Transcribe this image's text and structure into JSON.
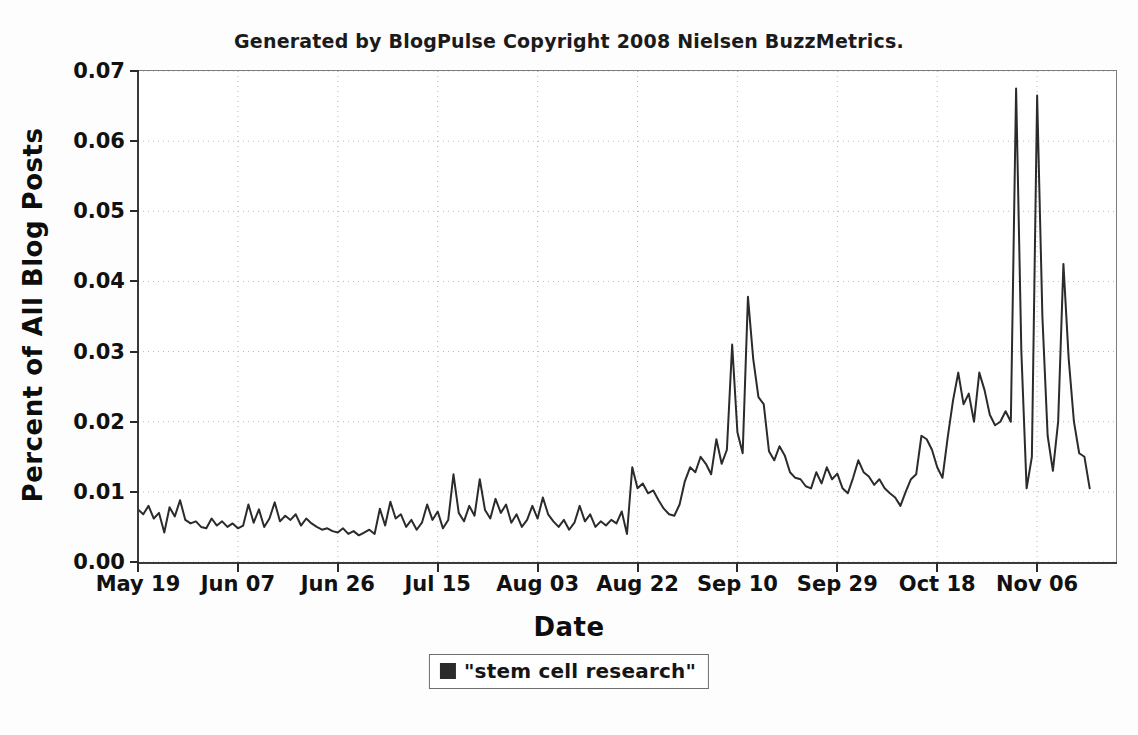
{
  "chart_data": {
    "type": "line",
    "title": "Generated by BlogPulse Copyright 2008 Nielsen BuzzMetrics.",
    "xlabel": "Date",
    "ylabel": "Percent of All Blog Posts",
    "legend": [
      "\"stem cell research\""
    ],
    "legend_position": "bottom-center",
    "grid": true,
    "grid_style": "dotted",
    "series_color": "#2b2b2b",
    "ylim": [
      0.0,
      0.07
    ],
    "ytick_labels": [
      "0.00",
      "0.01",
      "0.02",
      "0.03",
      "0.04",
      "0.05",
      "0.06",
      "0.07"
    ],
    "ytick_values": [
      0.0,
      0.01,
      0.02,
      0.03,
      0.04,
      0.05,
      0.06,
      0.07
    ],
    "xtick_labels": [
      "May 19",
      "Jun 07",
      "Jun 26",
      "Jul 15",
      "Aug 03",
      "Aug 22",
      "Sep 10",
      "Sep 29",
      "Oct 18",
      "Nov 06"
    ],
    "xtick_indices": [
      0,
      19,
      38,
      57,
      76,
      95,
      114,
      133,
      152,
      171
    ],
    "xlim_index": [
      0,
      186
    ],
    "series": [
      {
        "name": "\"stem cell research\"",
        "values": [
          0.0075,
          0.0068,
          0.008,
          0.0062,
          0.007,
          0.0042,
          0.0078,
          0.0065,
          0.0088,
          0.006,
          0.0055,
          0.0058,
          0.005,
          0.0048,
          0.0062,
          0.0052,
          0.0058,
          0.005,
          0.0055,
          0.0048,
          0.0052,
          0.0082,
          0.0056,
          0.0075,
          0.005,
          0.0062,
          0.0085,
          0.0058,
          0.0066,
          0.006,
          0.0068,
          0.0052,
          0.0062,
          0.0055,
          0.005,
          0.0046,
          0.0048,
          0.0044,
          0.0042,
          0.0048,
          0.004,
          0.0044,
          0.0038,
          0.0042,
          0.0046,
          0.004,
          0.0076,
          0.0052,
          0.0086,
          0.0062,
          0.0068,
          0.005,
          0.006,
          0.0046,
          0.0056,
          0.0082,
          0.006,
          0.0072,
          0.0048,
          0.006,
          0.0125,
          0.007,
          0.0058,
          0.008,
          0.0066,
          0.0118,
          0.0074,
          0.0062,
          0.009,
          0.007,
          0.0082,
          0.0056,
          0.0068,
          0.005,
          0.006,
          0.008,
          0.0062,
          0.0092,
          0.0068,
          0.0058,
          0.005,
          0.006,
          0.0046,
          0.0056,
          0.008,
          0.0058,
          0.0068,
          0.005,
          0.0058,
          0.0052,
          0.006,
          0.0055,
          0.0072,
          0.004,
          0.0135,
          0.0105,
          0.0112,
          0.0098,
          0.0102,
          0.0088,
          0.0076,
          0.0068,
          0.0066,
          0.0082,
          0.0115,
          0.0135,
          0.0128,
          0.015,
          0.014,
          0.0125,
          0.0175,
          0.014,
          0.016,
          0.031,
          0.0185,
          0.0155,
          0.0378,
          0.029,
          0.0235,
          0.0225,
          0.0158,
          0.0145,
          0.0165,
          0.0152,
          0.0128,
          0.012,
          0.0118,
          0.0108,
          0.0105,
          0.0128,
          0.0112,
          0.0135,
          0.0118,
          0.0126,
          0.0105,
          0.0098,
          0.012,
          0.0145,
          0.0128,
          0.0122,
          0.011,
          0.0118,
          0.0105,
          0.0098,
          0.0092,
          0.008,
          0.01,
          0.0118,
          0.0125,
          0.018,
          0.0175,
          0.016,
          0.0135,
          0.012,
          0.0178,
          0.023,
          0.027,
          0.0225,
          0.024,
          0.02,
          0.027,
          0.0245,
          0.021,
          0.0195,
          0.02,
          0.0215,
          0.02,
          0.0675,
          0.03,
          0.0105,
          0.015,
          0.0665,
          0.035,
          0.018,
          0.013,
          0.02,
          0.0425,
          0.029,
          0.02,
          0.0155,
          0.015,
          0.0105
        ]
      }
    ]
  }
}
